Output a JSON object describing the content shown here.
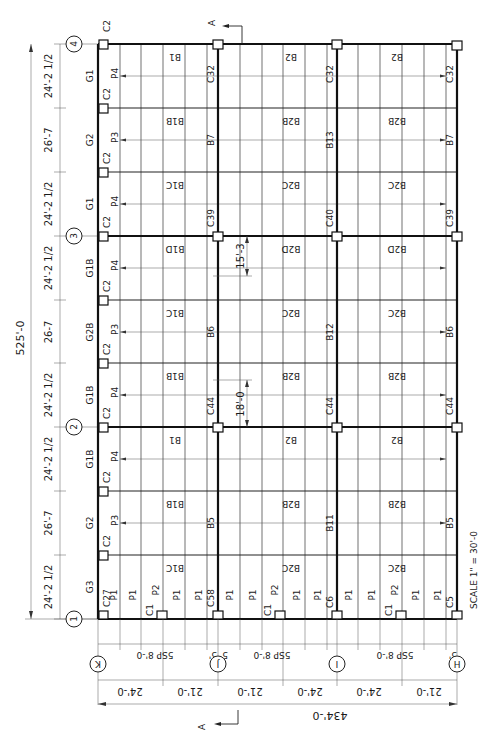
{
  "drawing": {
    "title": "Structural Framing Plan",
    "scale": "SCALE 1\" = 30'-0",
    "section_marker": "A",
    "overall_length": "525'-0",
    "overall_width": "434'-0"
  },
  "grid_lines": {
    "numbered": [
      "4",
      "3",
      "2",
      "1"
    ],
    "lettered": [
      "K",
      "J",
      "I",
      "H"
    ]
  },
  "long_dims": [
    "24'-2 1/2",
    "26'-7",
    "24'-2 1/2",
    "24'-2 1/2",
    "26-7",
    "24'-2 1/2",
    "24'-2 1/2",
    "26'-7",
    "24'-2 1/2"
  ],
  "girders": [
    "G1",
    "G2",
    "G1",
    "G1B",
    "G2B",
    "G1B",
    "G1B",
    "G2",
    "G3"
  ],
  "purlins_edge": [
    "P4",
    "P3",
    "P4",
    "P4",
    "P3",
    "P4",
    "P4",
    "P3"
  ],
  "edge_columns": [
    "C2",
    "C2",
    "C2",
    "C2",
    "C2",
    "C2",
    "C2",
    "C2",
    "C2",
    "C27"
  ],
  "column_marks": {
    "j_line": [
      "C32",
      "C39",
      "C44",
      "C58"
    ],
    "i_line": [
      "C32",
      "C40",
      "C44",
      "C6"
    ],
    "h_line": [
      "C32",
      "C39",
      "C44",
      "C5"
    ]
  },
  "beams_j_line": [
    "B7",
    "B6",
    "B5"
  ],
  "beams_i_line": [
    "B13",
    "B12",
    "B11"
  ],
  "beams_h_line": [
    "B7",
    "B6",
    "B5"
  ],
  "bay_beams_kj": [
    "B1",
    "B1B",
    "B1C",
    "B1D",
    "B1C",
    "B1B",
    "B1",
    "B1B",
    "B1C"
  ],
  "bay_beams_ji": [
    "B2",
    "B2B",
    "B2C",
    "B2D",
    "B2C",
    "B2B",
    "B2",
    "B2B",
    "B2C"
  ],
  "bay_beams_ih": [
    "B2",
    "B2B",
    "B2C",
    "B2D",
    "B2C",
    "B2B",
    "B2",
    "B2B",
    "B2C"
  ],
  "interior_dims": [
    "15'-3",
    "18'-0"
  ],
  "bottom_row": {
    "purlins": [
      "P1",
      "P1",
      "P2",
      "P1",
      "P1",
      "P1",
      "P1",
      "P2",
      "P1",
      "P1",
      "P1",
      "P1",
      "P2",
      "P1",
      "P1"
    ],
    "c1_marks": [
      "C1",
      "C1",
      "C1"
    ]
  },
  "spacing_dims": [
    "5SP 8'-0",
    "5'",
    "5'",
    "5SP 8'-0",
    "5SP 8'-0",
    "5'"
  ],
  "bay_dims": [
    "24'-0",
    "21'-0",
    "21'-0",
    "24'-0",
    "24'-0",
    "21'-0"
  ]
}
